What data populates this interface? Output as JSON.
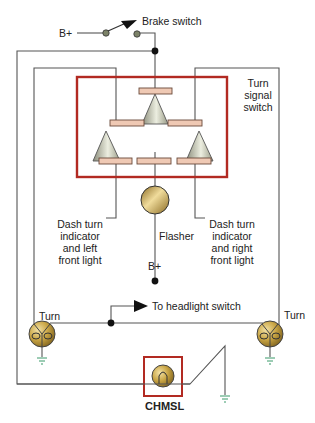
{
  "diagram": {
    "type": "wiring-schematic",
    "labels": {
      "brake_switch": "Brake switch",
      "b_plus_top": "B+",
      "turn_signal_switch": "Turn\nsignal\nswitch",
      "dash_left": "Dash turn\nindicator\nand left\nfront light",
      "dash_right": "Dash turn\nindicator\nand right\nfront light",
      "flasher": "Flasher",
      "b_plus_bottom": "B+",
      "to_headlight": "To headlight switch",
      "turn_left": "Turn",
      "turn_right": "Turn",
      "chmsl": "CHMSL"
    },
    "colors": {
      "wire": "#555555",
      "switch_box": "#b22a22",
      "contact_fill": "#efc9b4",
      "contact_stroke": "#6b4a3a",
      "bulb_gold": "#c9a544",
      "ground": "#3a9a6a",
      "junction": "#111111"
    },
    "components": [
      {
        "id": "brake-switch",
        "kind": "switch",
        "label_ref": "brake_switch"
      },
      {
        "id": "turn-signal-switch",
        "kind": "switch-assembly",
        "label_ref": "turn_signal_switch"
      },
      {
        "id": "flasher",
        "kind": "flasher",
        "label_ref": "flasher"
      },
      {
        "id": "left-rear-turn-lamp",
        "kind": "lamp",
        "label_ref": "turn_left"
      },
      {
        "id": "right-rear-turn-lamp",
        "kind": "lamp",
        "label_ref": "turn_right"
      },
      {
        "id": "chmsl-lamp",
        "kind": "lamp",
        "label_ref": "chmsl"
      }
    ]
  }
}
